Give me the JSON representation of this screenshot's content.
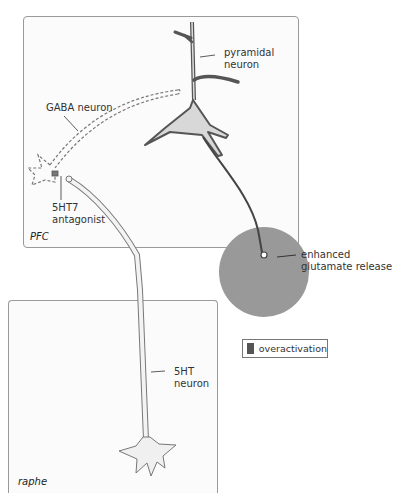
{
  "regions": {
    "pfc": {
      "label": "PFC"
    },
    "raphe": {
      "label": "raphe"
    }
  },
  "labels": {
    "pyramidal_neuron": "pyramidal\nneuron",
    "gaba_neuron": "GABA neuron",
    "antagonist": "5HT7\nantagonist",
    "glutamate_release": "enhanced\nglutamate release",
    "serotonin_neuron": "5HT\nneuron"
  },
  "legend": {
    "items": [
      {
        "label": "overactivation",
        "color": "#555555"
      }
    ]
  },
  "colors": {
    "overactivation_circle": "#999999",
    "neuron_outline": "#555555",
    "neuron_fill": "#d8d8d8",
    "panel_border": "#9a9a9a"
  }
}
